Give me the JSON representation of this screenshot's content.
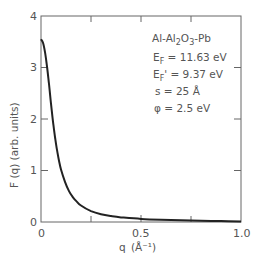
{
  "chart_data": {
    "type": "line",
    "title": "",
    "xlabel": "q (Å⁻¹)",
    "ylabel": "F (q)  (arb. units)",
    "xlim": [
      0,
      1.0
    ],
    "ylim": [
      0,
      4
    ],
    "grid": false,
    "x_tick_labels": [
      "0",
      "0.5",
      "1.0"
    ],
    "x_minor_ticks": [
      0.25,
      0.5,
      0.75
    ],
    "y_tick_labels": [
      "0",
      "1",
      "2",
      "3",
      "4"
    ],
    "annotations": [
      "Al-Al2O3-Pb",
      "EF = 11.63 eV",
      "EF' = 9.37 eV",
      "s = 25 Å",
      "φ = 2.5 eV"
    ],
    "series": [
      {
        "name": "F(q)",
        "x": [
          0,
          0.01,
          0.02,
          0.03,
          0.04,
          0.05,
          0.06,
          0.07,
          0.08,
          0.09,
          0.1,
          0.12,
          0.14,
          0.16,
          0.18,
          0.2,
          0.25,
          0.3,
          0.35,
          0.4,
          0.5,
          0.6,
          0.7,
          0.8,
          0.9,
          1.0
        ],
        "y": [
          3.55,
          3.48,
          3.3,
          3.02,
          2.68,
          2.3,
          1.95,
          1.65,
          1.4,
          1.19,
          1.02,
          0.78,
          0.6,
          0.48,
          0.39,
          0.32,
          0.21,
          0.15,
          0.115,
          0.09,
          0.06,
          0.045,
          0.033,
          0.024,
          0.017,
          0.012
        ]
      }
    ]
  },
  "labels": {
    "y_axis": "F (q)  (arb. units)",
    "x_axis_q": "q",
    "x_axis_unit": "(Å⁻¹)",
    "x_ticks": [
      "0",
      "0.5",
      "1.0"
    ],
    "y_ticks": [
      "0",
      "1",
      "2",
      "3",
      "4"
    ],
    "anno_system": "Al-Al₂O₃-Pb",
    "anno_ef": "E",
    "anno_ef_sub": "F",
    "anno_ef_val": " = 11.63 eV",
    "anno_efp_sub": "F",
    "anno_efp_val": "' = 9.37 eV",
    "anno_s": "s  =  25 Å",
    "anno_phi": "φ  =  2.5 eV"
  }
}
